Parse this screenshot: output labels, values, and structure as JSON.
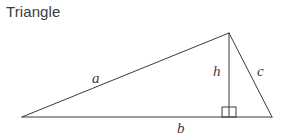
{
  "figure": {
    "title": "Triangle",
    "type": "geometry-diagram",
    "background_color": "#ffffff",
    "stroke_color": "#3b3b3b",
    "text_color": "#3b3b3b",
    "stroke_width": 1,
    "width": 283,
    "height": 139
  },
  "shape": {
    "name": "triangle",
    "vertices": [
      {
        "name": "left-vertex",
        "x": 22,
        "y": 117
      },
      {
        "name": "apex-vertex",
        "x": 229,
        "y": 33
      },
      {
        "name": "right-vertex",
        "x": 272,
        "y": 117
      }
    ],
    "altitude": {
      "name": "height-segment",
      "from_x": 229,
      "from_y": 33,
      "to_x": 229,
      "to_y": 117
    },
    "right_angle_marker": {
      "name": "right-angle-square",
      "x": 222,
      "y": 107,
      "size": 14
    }
  },
  "labels": {
    "a": "a",
    "b": "b",
    "c": "c",
    "h": "h"
  },
  "label_meanings": {
    "a": "left slanted side",
    "b": "base side",
    "c": "right slanted side",
    "h": "height (altitude) to the base"
  }
}
